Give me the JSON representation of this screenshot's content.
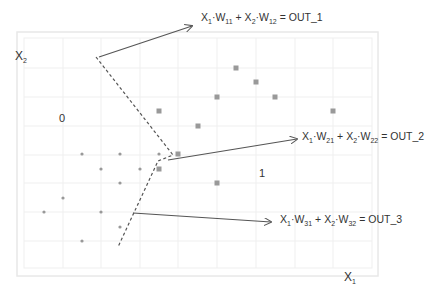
{
  "axes": {
    "x_label": "X",
    "x_sub": "1",
    "y_label": "X",
    "y_sub": "2"
  },
  "regions": {
    "class0_label": "0",
    "class1_label": "1"
  },
  "equations": [
    {
      "x1": "X",
      "s1": "1",
      "w1": "W",
      "ws1": "11",
      "plus": "+",
      "x2": "X",
      "s2": "2",
      "w2": "W",
      "ws2": "12",
      "rhs": "= OUT_1"
    },
    {
      "x1": "X",
      "s1": "1",
      "w1": "W",
      "ws1": "21",
      "plus": "+",
      "x2": "X",
      "s2": "2",
      "w2": "W",
      "ws2": "22",
      "rhs": "= OUT_2"
    },
    {
      "x1": "X",
      "s1": "1",
      "w1": "W",
      "ws1": "31",
      "plus": "+",
      "x2": "X",
      "s2": "2",
      "w2": "W",
      "ws2": "32",
      "rhs": "= OUT_3"
    }
  ],
  "colors": {
    "grid": "#ececec",
    "frame": "#e6e6e6",
    "points": "#999999",
    "lines": "#555555"
  },
  "points_class0": [
    [
      82,
      154
    ],
    [
      120,
      154
    ],
    [
      159,
      154
    ],
    [
      101,
      169
    ],
    [
      140,
      169
    ],
    [
      120,
      183
    ],
    [
      63,
      198
    ],
    [
      44,
      212
    ],
    [
      101,
      212
    ],
    [
      120,
      227
    ],
    [
      82,
      241
    ]
  ],
  "points_class1": [
    [
      159,
      111
    ],
    [
      217,
      97
    ],
    [
      236,
      68
    ],
    [
      256,
      82
    ],
    [
      275,
      97
    ],
    [
      333,
      111
    ],
    [
      198,
      126
    ],
    [
      178,
      154
    ],
    [
      159,
      169
    ],
    [
      217,
      183
    ]
  ]
}
